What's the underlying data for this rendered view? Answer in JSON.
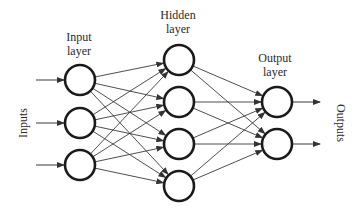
{
  "diagram": {
    "type": "feedforward-neural-network",
    "labels": {
      "input_layer": [
        "Input",
        "layer"
      ],
      "hidden_layer": [
        "Hidden",
        "layer"
      ],
      "output_layer": [
        "Output",
        "layer"
      ],
      "inputs": "Inputs",
      "outputs": "Outputs"
    },
    "layers": [
      {
        "name": "input",
        "x": 80,
        "nodes_y": [
          80,
          123,
          165
        ]
      },
      {
        "name": "hidden",
        "x": 179,
        "nodes_y": [
          60,
          102,
          144,
          186
        ]
      },
      {
        "name": "output",
        "x": 277,
        "nodes_y": [
          102,
          144
        ]
      }
    ],
    "node_radius": 15,
    "colors": {
      "node_stroke": "#1a1a1a",
      "edge": "#3a3a3a",
      "text": "#2a2a2a",
      "background": "#ffffff"
    }
  }
}
